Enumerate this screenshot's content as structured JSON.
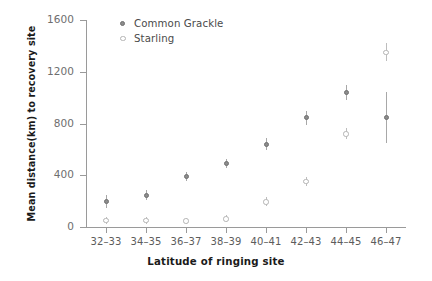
{
  "chart_data": {
    "type": "scatter",
    "title": "",
    "xlabel": "Latitude of ringing site",
    "ylabel": "Mean distance(km) to recovery site",
    "categories": [
      "32–33",
      "34–35",
      "36–37",
      "38–39",
      "40–41",
      "42–43",
      "44–45",
      "46–47"
    ],
    "ylim": [
      0,
      1600
    ],
    "yticks": [
      0,
      400,
      800,
      1200,
      1600
    ],
    "ytick_labels": [
      "0",
      "400",
      "800",
      "1200",
      "1600"
    ],
    "grid": false,
    "legend_position": "top-left-inside",
    "series": [
      {
        "name": "Common Grackle",
        "marker": "filled-circle",
        "color": "#8c8c8c",
        "values": [
          200,
          245,
          390,
          490,
          640,
          845,
          1040,
          845
        ],
        "err_low": [
          150,
          205,
          355,
          455,
          595,
          790,
          985,
          650
        ],
        "err_high": [
          250,
          285,
          425,
          525,
          690,
          900,
          1095,
          1045
        ]
      },
      {
        "name": "Starling",
        "marker": "open-circle",
        "color": "#b4b4b4",
        "values": [
          50,
          50,
          45,
          60,
          195,
          350,
          720,
          1350
        ],
        "err_low": [
          25,
          25,
          25,
          35,
          165,
          315,
          680,
          1280
        ],
        "err_high": [
          80,
          80,
          70,
          90,
          230,
          390,
          765,
          1425
        ]
      }
    ]
  },
  "legend": {
    "items": [
      {
        "label": "Common Grackle",
        "marker": "filled-circle"
      },
      {
        "label": "Starling",
        "marker": "open-circle"
      }
    ]
  }
}
